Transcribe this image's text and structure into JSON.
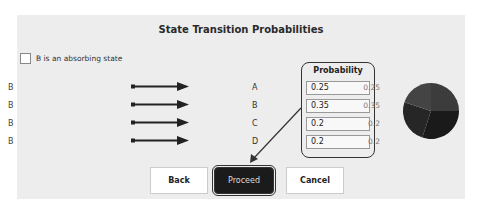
{
  "dialog": {
    "title": "State Transition Probabilities",
    "absorbing_checkbox": {
      "label": "B is an absorbing state",
      "checked": false
    }
  },
  "transitions": [
    {
      "from": "B",
      "to": "A",
      "probability": "0.25",
      "display_value": "0.25"
    },
    {
      "from": "B",
      "to": "B",
      "probability": "0.35",
      "display_value": "0.35"
    },
    {
      "from": "B",
      "to": "C",
      "probability": "0.2",
      "display_value": "0.2"
    },
    {
      "from": "B",
      "to": "D",
      "probability": "0.2",
      "display_value": "0.2"
    }
  ],
  "probability_header": "Probability",
  "buttons": {
    "back": "Back",
    "proceed": "Proceed",
    "cancel": "Cancel"
  },
  "pie": {
    "slices": [
      0.25,
      0.35,
      0.2,
      0.2
    ],
    "colors": [
      "#3a3a3a",
      "#222222",
      "#101010",
      "#2c2c2c"
    ]
  }
}
